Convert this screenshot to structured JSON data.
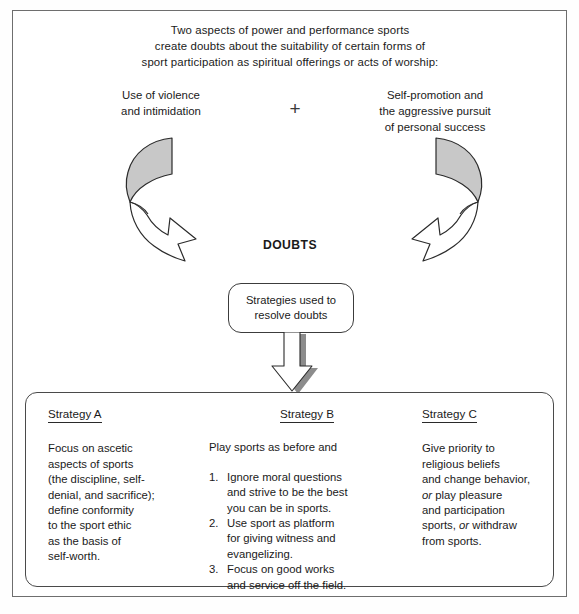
{
  "header": {
    "lines": [
      "Two aspects of power and performance sports",
      "create doubts about the suitability of certain forms of",
      "sport participation as spiritual offerings or acts of worship:"
    ]
  },
  "aspects": {
    "left": {
      "line1": "Use of violence",
      "line2": "and intimidation"
    },
    "operator": "+",
    "right": {
      "line1": "Self-promotion and",
      "line2": "the aggressive pursuit",
      "line3": "of personal success"
    }
  },
  "center": {
    "doubts_label": "DOUBTS",
    "strategies_box": {
      "line1": "Strategies used to",
      "line2": "resolve doubts"
    }
  },
  "strategies": {
    "a": {
      "title": "Strategy A",
      "lines": [
        "Focus on ascetic",
        "aspects of sports",
        "(the discipline, self-",
        "denial, and sacrifice);",
        "define conformity",
        "to the sport ethic",
        "as the basis of",
        "self-worth."
      ]
    },
    "b": {
      "title": "Strategy B",
      "lead": "Play sports as before and",
      "items": [
        {
          "num": "1.",
          "lines": [
            "Ignore moral questions",
            "and strive to be the best",
            "you can be in sports."
          ]
        },
        {
          "num": "2.",
          "lines": [
            "Use sport as platform",
            "for giving witness and",
            "evangelizing."
          ]
        },
        {
          "num": "3.",
          "lines": [
            "Focus on good works",
            "and service off the field."
          ]
        }
      ]
    },
    "c": {
      "title": "Strategy C",
      "segments": [
        {
          "text": "Give priority to",
          "italic": false,
          "break": true
        },
        {
          "text": "religious beliefs",
          "italic": false,
          "break": true
        },
        {
          "text": "and change behavior,",
          "italic": false,
          "break": true
        },
        {
          "text": "or",
          "italic": true,
          "break": false
        },
        {
          "text": " play pleasure",
          "italic": false,
          "break": true
        },
        {
          "text": "and participation",
          "italic": false,
          "break": true
        },
        {
          "text": "sports, ",
          "italic": false,
          "break": false
        },
        {
          "text": "or",
          "italic": true,
          "break": false
        },
        {
          "text": " withdraw",
          "italic": false,
          "break": true
        },
        {
          "text": "from sports.",
          "italic": false,
          "break": false
        }
      ]
    }
  },
  "colors": {
    "arrow_fill_gray": "#c8c8c8",
    "arrow_stroke": "#2b2b2b",
    "frame_stroke": "#6e6e6e",
    "shadow_gray": "#909090"
  },
  "icons": {
    "left_cycle_arrow": "curved-arrow-clockwise",
    "right_cycle_arrow": "curved-arrow-counterclockwise",
    "down_block_arrow": "down-arrow"
  }
}
